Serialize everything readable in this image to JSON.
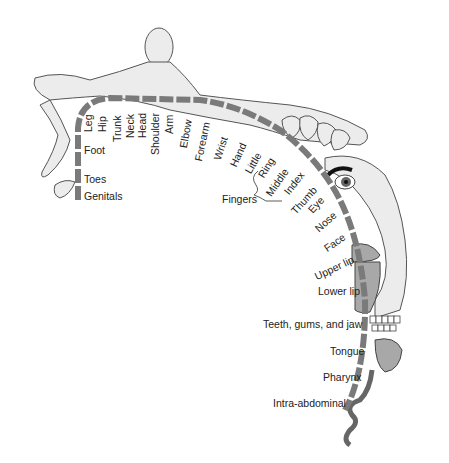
{
  "diagram": {
    "type": "somatosensory homunculus",
    "colors": {
      "strip": "#7a7a7a",
      "body": "#ececec",
      "outline": "#444444",
      "lip": "#a8a8a8",
      "text": "#222222"
    },
    "labels": {
      "leg": "Leg",
      "hip": "Hip",
      "trunk": "Trunk",
      "neck": "Neck",
      "head": "Head",
      "shoulder": "Shoulder",
      "arm": "Arm",
      "elbow": "Elbow",
      "forearm": "Forearm",
      "wrist": "Wrist",
      "hand": "Hand",
      "little": "Little",
      "ring": "Ring",
      "middle": "Middle",
      "index": "Index",
      "thumb": "Thumb",
      "fingers": "Fingers",
      "eye": "Eye",
      "nose": "Nose",
      "face": "Face",
      "upper_lip": "Upper lip",
      "lower_lip": "Lower lip",
      "teeth": "Teeth, gums, and jaw",
      "tongue": "Tongue",
      "pharynx": "Pharynx",
      "intra_abdominal": "Intra-abdominal",
      "foot": "Foot",
      "toes": "Toes",
      "genitals": "Genitals"
    }
  }
}
